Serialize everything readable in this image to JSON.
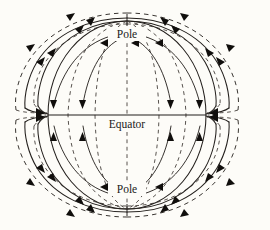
{
  "figure": {
    "kind": "schematic-diagram",
    "background_color": "#fdfcf8",
    "line_color": "#231f1c",
    "arrow_color": "#100e0c",
    "width": 270,
    "height": 230
  },
  "labels": {
    "north_pole": "Pole",
    "equator": "Equator",
    "south_pole": "Pole"
  },
  "geometry": {
    "sphere_center_x": 127,
    "sphere_center_y": 115,
    "sphere_radius_x": 79,
    "sphere_radius_y": 94,
    "equator_y": 115,
    "north_pole_y": 21,
    "south_pole_y": 209,
    "pinch_left_x": 48,
    "pinch_right_x": 206
  },
  "elements": {
    "interior_field_lines": "solid and dashed meridian arcs from pole to equator",
    "exterior_field_lines": "nested solid and dashed arcs outside the sphere",
    "neutral_points": "converging arrowheads on the equatorial plane at left and right",
    "pole_markers": "short vertical ticks at each pole"
  }
}
